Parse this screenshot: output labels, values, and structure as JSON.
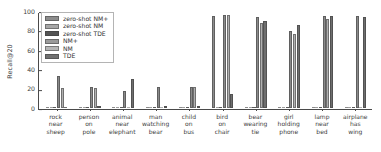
{
  "chart_data": {
    "type": "bar",
    "title": "",
    "xlabel": "",
    "ylabel": "Recall@20",
    "ylim": [
      0,
      100
    ],
    "yticks": [
      0,
      20,
      40,
      60,
      80,
      100
    ],
    "grid": false,
    "legend_position": "upper left",
    "categories": [
      "rock\nnear\nsheep",
      "person\non\npole",
      "animal\nnear\nelephant",
      "man\nwatching\nbear",
      "child\non\nbus",
      "bird\non\nchair",
      "bear\nwearing\ntie",
      "girl\nholding\nphone",
      "lamp\nnear\nbed",
      "airplane\nhas\nwing"
    ],
    "series": [
      {
        "name": "zero-shot NM+",
        "color": "#8c8c8c",
        "values": [
          0,
          0,
          0,
          0,
          0,
          96,
          0,
          0,
          0,
          0
        ]
      },
      {
        "name": "zero-shot NM",
        "color": "#9e9e9e",
        "values": [
          0,
          0,
          0,
          0,
          0,
          0,
          0,
          0,
          0,
          0
        ]
      },
      {
        "name": "zero-shot TDE",
        "color": "#5a5a5a",
        "values": [
          0,
          0,
          0,
          0,
          0,
          0,
          0,
          0,
          0,
          0
        ]
      },
      {
        "name": "NM+",
        "color": "#8a8a8a",
        "values": [
          33,
          22,
          18,
          22,
          22,
          97,
          95,
          80,
          96,
          96
        ]
      },
      {
        "name": "NM",
        "color": "#b0b0b0",
        "values": [
          21,
          21,
          0,
          0,
          22,
          97,
          89,
          77,
          93,
          0
        ]
      },
      {
        "name": "TDE",
        "color": "#6e6e6e",
        "values": [
          0,
          1,
          30,
          1,
          1,
          15,
          91,
          86,
          96,
          95
        ]
      }
    ]
  },
  "legend": {
    "items": [
      {
        "label": "zero-shot NM+",
        "color": "#8c8c8c"
      },
      {
        "label": "zero-shot NM",
        "color": "#a6a6a6"
      },
      {
        "label": "zero-shot TDE",
        "color": "#545454"
      },
      {
        "label": "NM+",
        "color": "#9a9a9a"
      },
      {
        "label": "NM",
        "color": "#b6b6b6"
      },
      {
        "label": "TDE",
        "color": "#707070"
      }
    ]
  }
}
